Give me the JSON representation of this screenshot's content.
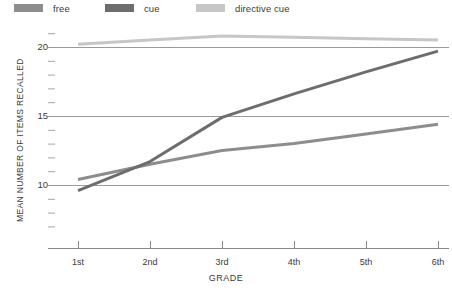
{
  "legend": {
    "position": "top-left",
    "items": [
      {
        "label": "free",
        "color": "#8d8d8d",
        "swatch_name": "legend-swatch-free"
      },
      {
        "label": "cue",
        "color": "#6d6d6d",
        "swatch_name": "legend-swatch-cue"
      },
      {
        "label": "directive cue",
        "color": "#c6c6c6",
        "swatch_name": "legend-swatch-directive-cue"
      }
    ]
  },
  "axes": {
    "x_title": "GRADE",
    "y_title": "MEAN NUMBER OF ITEMS RECALLED",
    "x_tick_labels": [
      "1st",
      "2nd",
      "3rd",
      "4th",
      "5th",
      "6th"
    ],
    "y_tick_labels": [
      "10",
      "15",
      "20"
    ]
  },
  "chart_data": {
    "type": "line",
    "title": "",
    "xlabel": "GRADE",
    "ylabel": "MEAN NUMBER OF ITEMS RECALLED",
    "categories": [
      "1st",
      "2nd",
      "3rd",
      "4th",
      "5th",
      "6th"
    ],
    "x": [
      1,
      2,
      3,
      4,
      5,
      6
    ],
    "xlim": [
      0.55,
      6.3
    ],
    "ylim": [
      6.2,
      21.8
    ],
    "yticks": [
      10,
      15,
      20
    ],
    "grid": "horizontal-major-only",
    "minor_ticks_y": true,
    "legend_position": "top-left",
    "series": [
      {
        "name": "free",
        "color": "#8d8d8d",
        "values": [
          10.4,
          11.5,
          12.5,
          13.0,
          13.7,
          14.4
        ]
      },
      {
        "name": "cue",
        "color": "#6d6d6d",
        "values": [
          9.6,
          11.7,
          14.9,
          16.6,
          18.2,
          19.7
        ]
      },
      {
        "name": "directive cue",
        "color": "#c6c6c6",
        "values": [
          20.2,
          20.5,
          20.8,
          20.7,
          20.6,
          20.5
        ]
      }
    ]
  }
}
